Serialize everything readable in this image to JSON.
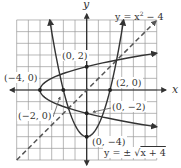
{
  "figure": {
    "axes": {
      "x_label": "x",
      "y_label": "y",
      "x_range": [
        -6,
        6
      ],
      "y_range": [
        -6,
        6
      ],
      "grid": true,
      "grid_step": 1
    },
    "curves": [
      {
        "name": "parabola",
        "equation_label": "y = x² − 4",
        "equation": "y = x^2 - 4",
        "style": "solid"
      },
      {
        "name": "sideways-parabola",
        "equation_label": "y = ± √x + 4",
        "equation": "y = ±sqrt(x+4)",
        "style": "solid"
      },
      {
        "name": "identity-line",
        "equation": "y = x",
        "style": "dashed"
      }
    ],
    "points": [
      {
        "label": "(0, 2)",
        "x": 0,
        "y": 2
      },
      {
        "label": "(−4, 0)",
        "x": -4,
        "y": 0
      },
      {
        "label": "(2, 0)",
        "x": 2,
        "y": 0
      },
      {
        "label": "(0, −2)",
        "x": 0,
        "y": -2
      },
      {
        "label": "(−2, 0)",
        "x": -2,
        "y": 0
      },
      {
        "label": "(0, −4)",
        "x": 0,
        "y": -4
      }
    ],
    "colors": {
      "curve": "#333333",
      "dashed": "#555555",
      "grid": "#9a9a9a"
    }
  },
  "chart_data": {
    "type": "line",
    "title": "",
    "xlabel": "x",
    "ylabel": "y",
    "xlim": [
      -6,
      6
    ],
    "ylim": [
      -6,
      6
    ],
    "grid": true,
    "series": [
      {
        "name": "y = x² − 4",
        "x": [
          -3.16,
          -2,
          -1,
          0,
          1,
          2,
          3.16
        ],
        "y": [
          6,
          0,
          -3,
          -4,
          -3,
          0,
          6
        ]
      },
      {
        "name": "y = ±√(x+4)",
        "x": [
          -4,
          -3,
          -2,
          0,
          2,
          6
        ],
        "y_upper": [
          0,
          1,
          1.41,
          2,
          2.45,
          3.16
        ],
        "y_lower": [
          0,
          -1,
          -1.41,
          -2,
          -2.45,
          -3.16
        ]
      },
      {
        "name": "y = x (dashed)",
        "x": [
          -6,
          6
        ],
        "y": [
          -6,
          6
        ]
      }
    ],
    "annotations": [
      "(0, 2)",
      "(−4, 0)",
      "(2, 0)",
      "(0, −2)",
      "(−2, 0)",
      "(0, −4)",
      "y = x² − 4",
      "y = ± √x + 4"
    ]
  }
}
